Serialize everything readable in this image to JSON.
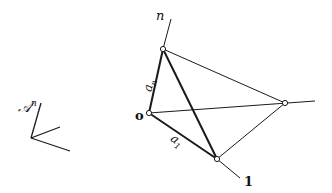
{
  "labels": {
    "space": "𝒜",
    "space_sup": "n",
    "vertex_n": "n",
    "vertex_o": "o",
    "vertex_1": "1",
    "edge_an": "a",
    "edge_an_sub": "n",
    "edge_a1": "a",
    "edge_a1_sub": "1"
  },
  "colors": {
    "stroke": "#1a1a1a",
    "background": "#ffffff"
  }
}
